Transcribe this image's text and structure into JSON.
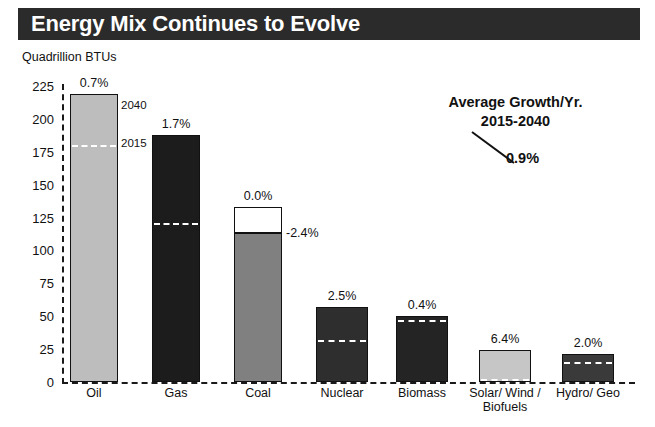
{
  "title": "Energy Mix Continues to Evolve",
  "axis_unit": "Quadrillion BTUs",
  "annotation": {
    "line1": "Average Growth/Yr.",
    "line2": "2015-2040",
    "value": "0.9%"
  },
  "oil_callouts": {
    "top": "2040",
    "dash": "2015"
  },
  "coal_callout": "-2.4%",
  "chart_data": {
    "type": "bar",
    "title": "Energy Mix Continues to Evolve",
    "xlabel": "",
    "ylabel": "Quadrillion BTUs",
    "ylim": [
      0,
      225
    ],
    "yticks": [
      0,
      25,
      50,
      75,
      100,
      125,
      150,
      175,
      200,
      225
    ],
    "grid": false,
    "legend": null,
    "categories": [
      "Oil",
      "Gas",
      "Coal",
      "Nuclear",
      "Biomass",
      "Solar/ Wind /\nBiofuels",
      "Hydro/ Geo"
    ],
    "series": [
      {
        "name": "2040 projection (Quadrillion BTUs)",
        "values": [
          219,
          188,
          133,
          57,
          50,
          24,
          21
        ]
      },
      {
        "name": "2015 level (Quadrillion BTUs)",
        "values": [
          180,
          121,
          113,
          32,
          47,
          2,
          15
        ]
      }
    ],
    "data_labels": {
      "name": "Average Growth/Yr. 2015-2040",
      "values": [
        "0.7%",
        "1.7%",
        "0.0%",
        "2.5%",
        "0.4%",
        "6.4%",
        "2.0%"
      ]
    },
    "extra_labels": {
      "coal_2040_growth": "-2.4%",
      "total_growth": "0.9%"
    },
    "bar_colors": [
      "#bdbdbd",
      "#1c1c1c",
      "#808080",
      "#2e2e2e",
      "#242424",
      "#c6c6c6",
      "#3a3a3a"
    ]
  },
  "bars": [
    {
      "label": "Oil",
      "growth": "0.7%",
      "value_2040": 219,
      "value_2015": 180,
      "color": "#bdbdbd",
      "dash_color": "#ffffff",
      "x": 70,
      "width": 48
    },
    {
      "label": "Gas",
      "growth": "1.7%",
      "value_2040": 188,
      "value_2015": 121,
      "color": "#1c1c1c",
      "dash_color": "#ffffff",
      "x": 152,
      "width": 48
    },
    {
      "label": "Coal",
      "growth": "0.0%",
      "value_2040": 133,
      "value_2015": 113,
      "color": "#808080",
      "dash_color": "#2b2b2b",
      "x": 234,
      "width": 48
    },
    {
      "label": "Nuclear",
      "growth": "2.5%",
      "value_2040": 57,
      "value_2015": 32,
      "color": "#2e2e2e",
      "dash_color": "#ffffff",
      "x": 316,
      "width": 52
    },
    {
      "label": "Biomass",
      "growth": "0.4%",
      "value_2040": 50,
      "value_2015": 47,
      "color": "#242424",
      "dash_color": "#ffffff",
      "x": 396,
      "width": 52
    },
    {
      "label": "Solar/ Wind /",
      "label2": "Biofuels",
      "growth": "6.4%",
      "value_2040": 24,
      "value_2015": 2,
      "color": "#c6c6c6",
      "dash_color": "#ffffff",
      "x": 479,
      "width": 52
    },
    {
      "label": "Hydro/ Geo",
      "growth": "2.0%",
      "value_2040": 21,
      "value_2015": 15,
      "color": "#3a3a3a",
      "dash_color": "#ffffff",
      "x": 562,
      "width": 52
    }
  ]
}
